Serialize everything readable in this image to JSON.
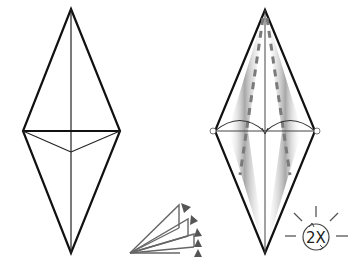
{
  "diagram": {
    "type": "origami-instruction",
    "steps": [
      {
        "id": "step-before",
        "description": "Kite/diamond base with horizontal crease and valley folds meeting center"
      },
      {
        "id": "step-after",
        "description": "Diamond with dashed valley-fold lines and arc arrows showing fold-in of both sides"
      }
    ],
    "fold_icon": {
      "name": "fan-fold-symbol",
      "description": "Repeated fold (pleat) symbol with arrows"
    },
    "repeat_symbol": {
      "label": "2X",
      "meaning": "repeat twice"
    },
    "colors": {
      "line": "#111111",
      "thin_line": "#444444",
      "dashed": "#8a8a8a",
      "shade": "#9a9a9a",
      "icon": "#666666"
    }
  }
}
